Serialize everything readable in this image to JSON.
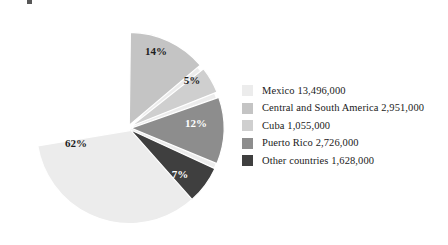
{
  "chart_data": {
    "type": "pie",
    "title": "",
    "subtitle": "",
    "xlabel": "",
    "ylabel": "",
    "grid": false,
    "legend_position": "right",
    "start_angle_deg": 0,
    "direction": "clockwise",
    "categories": [
      "Mexico",
      "Central and South America",
      "Cuba",
      "Puerto Rico",
      "Other countries"
    ],
    "values": [
      13496000,
      2951000,
      1055000,
      2726000,
      1628000
    ],
    "value_labels": [
      "13,496,000",
      "2,951,000",
      "1,055,000",
      "2,726,000",
      "1,628,000"
    ],
    "percent_labels": [
      "62%",
      "14%",
      "5%",
      "12%",
      "7%"
    ],
    "percentages": [
      62,
      14,
      5,
      12,
      7
    ],
    "colors": [
      "#ececec",
      "#c4c4c4",
      "#cfcfcf",
      "#8d8d8d",
      "#3f3f3f"
    ],
    "label_text_colors": [
      "#1d1d1d",
      "#1d1d1d",
      "#1d1d1d",
      "#ffffff",
      "#ffffff"
    ],
    "slices": [
      {
        "name": "Mexico",
        "percent_label": "62%",
        "percent": 62,
        "value": 13496000,
        "value_label": "13,496,000",
        "color": "#ececec",
        "label_fill": "dark",
        "start_deg": 38,
        "sweep_deg": 223.2,
        "label_x": 76,
        "label_y": 147
      },
      {
        "name": "Central and South America",
        "percent_label": "14%",
        "percent": 14,
        "value": 2951000,
        "value_label": "2,951,000",
        "color": "#c4c4c4",
        "label_fill": "dark",
        "start_deg": 0,
        "sweep_deg": 50.4,
        "label_x": 156,
        "label_y": 55
      },
      {
        "name": "Cuba",
        "percent_label": "5%",
        "percent": 5,
        "value": 1055000,
        "value_label": "1,055,000",
        "color": "#cfcfcf",
        "label_fill": "dark",
        "start_deg": 51,
        "sweep_deg": 18,
        "label_x": 192,
        "label_y": 84
      },
      {
        "name": "Puerto Rico",
        "percent_label": "12%",
        "percent": 12,
        "value": 2726000,
        "value_label": "2,726,000",
        "color": "#8d8d8d",
        "label_fill": "light",
        "start_deg": 70,
        "sweep_deg": 43.2,
        "label_x": 196,
        "label_y": 127
      },
      {
        "name": "Other countries",
        "percent_label": "7%",
        "percent": 7,
        "value": 1628000,
        "value_label": "1,628,000",
        "color": "#3f3f3f",
        "label_fill": "light",
        "start_deg": 114,
        "sweep_deg": 25.2,
        "label_x": 180,
        "label_y": 178
      }
    ]
  },
  "legend": {
    "entries": [
      {
        "label": "Mexico 13,496,000",
        "color": "#ececec"
      },
      {
        "label": "Central and South America 2,951,000",
        "color": "#c4c4c4"
      },
      {
        "label": "Cuba 1,055,000",
        "color": "#cfcfcf"
      },
      {
        "label": "Puerto Rico 2,726,000",
        "color": "#8d8d8d"
      },
      {
        "label": "Other countries 1,628,000",
        "color": "#3f3f3f"
      }
    ]
  },
  "geometry": {
    "center_x": 128,
    "center_y": 128,
    "radius": 93,
    "gap_deg": 1.4,
    "explode": 3
  }
}
